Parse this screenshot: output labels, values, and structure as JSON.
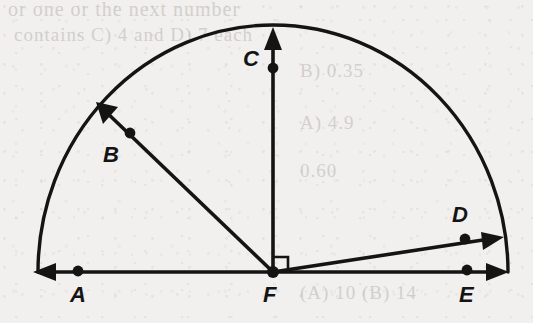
{
  "figure": {
    "type": "geometry-diagram",
    "width": 533,
    "height": 323,
    "background_color": "#f1f0ee",
    "ink_color": "#141414"
  },
  "labels": {
    "A": "A",
    "B": "B",
    "C": "C",
    "D": "D",
    "E": "E",
    "F": "F"
  },
  "ghost_text": {
    "line1": "or one or the next number",
    "line2": "contains C) 4 and D) 7 each",
    "line3": "B) 0.35",
    "line4": "A) 4.9",
    "line5": "0.60",
    "line6": "(A) 10 (B) 14"
  },
  "geometry": {
    "center": {
      "name": "F",
      "x": 273,
      "y": 272
    },
    "semicircle": {
      "radius_x": 235,
      "radius_y": 247,
      "start_angle_deg": 0,
      "end_angle_deg": 180
    },
    "baseline": {
      "x1": 33,
      "x2": 509,
      "y": 272
    },
    "points": [
      {
        "name": "A",
        "x": 78,
        "y": 271,
        "label_x": 70,
        "label_y": 284
      },
      {
        "name": "B",
        "x": 130,
        "y": 133,
        "label_x": 103,
        "label_y": 144
      },
      {
        "name": "C",
        "x": 273,
        "y": 68,
        "label_x": 243,
        "label_y": 48
      },
      {
        "name": "D",
        "x": 465,
        "y": 239,
        "label_x": 452,
        "label_y": 204
      },
      {
        "name": "E",
        "x": 467,
        "y": 270,
        "label_x": 459,
        "label_y": 284
      },
      {
        "name": "F",
        "x": 273,
        "y": 272,
        "label_x": 263,
        "label_y": 284
      }
    ],
    "rays": [
      {
        "name": "ray-FA",
        "from": "F",
        "through": "A",
        "angle_deg": 180,
        "arrow_tip_x": 33,
        "arrow_tip_y": 272
      },
      {
        "name": "ray-FB",
        "from": "F",
        "through": "B",
        "angle_deg": 139,
        "arrow_tip_x": 96,
        "arrow_tip_y": 102
      },
      {
        "name": "ray-FC",
        "from": "F",
        "through": "C",
        "angle_deg": 90,
        "arrow_tip_x": 273,
        "arrow_tip_y": 27
      },
      {
        "name": "ray-FD",
        "from": "F",
        "through": "D",
        "angle_deg": 9,
        "arrow_tip_x": 504,
        "arrow_tip_y": 237
      },
      {
        "name": "ray-FE",
        "from": "F",
        "through": "E",
        "angle_deg": 0,
        "arrow_tip_x": 509,
        "arrow_tip_y": 272
      }
    ],
    "right_angle_marker": {
      "between": [
        "ray-FC",
        "ray-FE"
      ],
      "size": 15
    }
  }
}
